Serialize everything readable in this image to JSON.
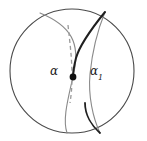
{
  "figure": {
    "kind": "geometric-diagram",
    "width": 147,
    "height": 141,
    "background_color": "#ffffff"
  },
  "labels": {
    "alpha": {
      "base": "α",
      "subscript": "",
      "x": 50,
      "y": 65,
      "color": "#1a1a1a"
    },
    "alpha_one": {
      "base": "α",
      "subscript": "1",
      "x": 90,
      "y": 65,
      "color": "#1a1a1a"
    }
  },
  "shapes": {
    "boundary_circle": {
      "name": "boundary-circle",
      "cx": 72,
      "cy": 71,
      "r": 62,
      "stroke": "#4a4a4a",
      "stroke_width": 1.1,
      "fill": "none"
    },
    "alpha_curve": {
      "name": "alpha-curve",
      "path": "M 40 13 C 72 26, 80 44, 74 72 C 69 96, 62 118, 67 133",
      "stroke": "#8a8a8a",
      "stroke_width": 1.1
    },
    "alpha_dashed_segment": {
      "name": "alpha-dashed-segment",
      "path": "M 68 25 C 70 44, 72 58, 72 77 C 72 89, 71 96, 70 103",
      "stroke": "#9a9a9a",
      "stroke_width": 1.3,
      "dash_array": "4 3"
    },
    "alpha_one_curve": {
      "name": "alpha-one-curve",
      "path": "M 105 12 C 92 28, 80 44, 76 58 C 74 66, 73 72, 73 77",
      "stroke": "#1f1f1f",
      "stroke_width": 2.0
    },
    "right_companion_curve": {
      "name": "right-companion-curve",
      "path": "M 105 12 C 96 34, 92 54, 90 74 C 88 96, 93 118, 100 133",
      "stroke": "#8a8a8a",
      "stroke_width": 1.1
    },
    "lower_dark_arc": {
      "name": "lower-dark-arc",
      "path": "M 85 103 C 85 115, 92 126, 100 133",
      "stroke": "#1f1f1f",
      "stroke_width": 1.8
    },
    "junction_point": {
      "name": "junction-point",
      "cx": 73,
      "cy": 77,
      "r": 3.4,
      "fill": "#111111"
    }
  }
}
